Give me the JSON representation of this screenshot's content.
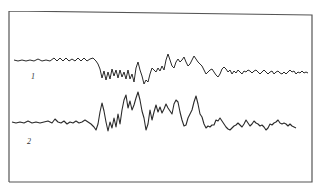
{
  "figure": {
    "frame_color": "#555555",
    "trace_color": "#2a2a2a",
    "traces": [
      {
        "label": "1",
        "points": "14,60 18,61 22,60 26,61 30,60 34,61 38,59 42,61 46,60 50,61 54,58 57,61 60,58 63,61 66,58 69,61 72,59 75,61 78,58 81,61 84,58 87,61 90,59 93,58 96,61 98,64 100,69 102,78 104,71 106,80 108,72 110,79 112,69 114,76 116,70 118,78 120,70 122,77 124,72 126,79 128,70 130,79 132,74 134,82 136,68 138,62 140,70 142,76 144,84 146,80 148,82 150,74 152,68 154,70 156,72 158,68 160,71 162,66 164,70 166,60 168,54 170,60 172,66 174,68 176,62 178,59 180,62 182,60 184,57 186,62 188,66 190,64 192,60 194,56 196,59 198,62 200,64 202,66 204,70 206,74 208,72 210,70 212,69 214,72 216,75 218,77 220,74 222,69 224,67 226,69 228,72 230,70 232,74 234,71 236,73 238,70 240,72 242,74 244,71 246,72 248,70 250,71 252,73 254,71 256,70 258,72 260,74 262,72 264,70 266,72 268,74 270,72 272,71 274,74 276,72 278,71 280,73 282,74 284,72 286,74 288,72 290,70 292,72 294,71 296,74 298,72 300,73 302,71 304,73 306,72 308,73",
        "color": "#2a2a2a"
      },
      {
        "label": "2",
        "points": "12,122 16,123 20,122 24,123 28,121 32,123 36,122 40,123 44,122 48,121 52,123 55,119 58,122 61,123 64,121 67,124 70,122 73,123 76,121 79,123 82,122 85,120 88,122 91,124 94,127 96,130 98,124 100,112 102,103 104,111 106,122 108,131 110,122 112,128 114,118 116,127 118,114 120,124 122,110 124,100 126,95 128,108 130,101 132,110 134,105 136,98 138,92 140,100 142,111 144,118 146,130 148,124 150,110 152,120 154,112 156,105 158,112 160,107 162,113 164,109 166,104 168,108 170,111 172,114 174,104 176,100 178,102 180,112 182,120 184,126 186,125 188,118 190,114 192,110 194,102 196,96 198,104 200,114 202,117 204,124 206,128 208,126 210,127 212,125 214,125 216,120 218,121 220,118 222,121 224,124 226,127 228,129 230,130 232,128 234,126 236,125 238,123 240,125 242,127 244,124 246,120 248,123 250,126 252,124 254,121 256,123 258,124 260,126 262,125 264,127 266,130 268,128 270,124 272,125 274,123 276,122 278,120 280,123 282,124 284,123 286,124 288,126 290,124 292,126 294,127 296,128",
        "color": "#2a2a2a"
      }
    ]
  }
}
